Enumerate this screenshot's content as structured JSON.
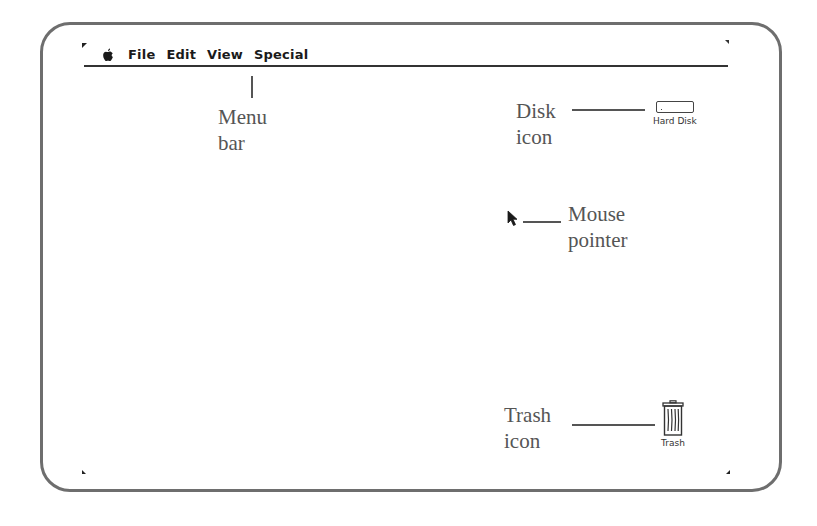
{
  "menubar": {
    "apple_icon": "apple-icon",
    "items": [
      {
        "label": "File"
      },
      {
        "label": "Edit"
      },
      {
        "label": "View"
      },
      {
        "label": "Special"
      }
    ]
  },
  "desktop_icons": {
    "hard_disk": {
      "label": "Hard Disk",
      "icon": "hard-disk-icon"
    },
    "trash": {
      "label": "Trash",
      "icon": "trash-icon"
    }
  },
  "callouts": {
    "menu_bar": {
      "line1": "Menu",
      "line2": "bar"
    },
    "disk_icon": {
      "line1": "Disk",
      "line2": "icon"
    },
    "mouse_pointer": {
      "line1": "Mouse",
      "line2": "pointer"
    },
    "trash_icon": {
      "line1": "Trash",
      "line2": "icon"
    }
  },
  "colors": {
    "frame": "#6e6e6e",
    "callout_text": "#555555",
    "menu_text": "#1a1a1a"
  }
}
